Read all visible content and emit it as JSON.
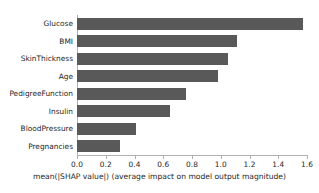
{
  "chart_data": {
    "type": "bar",
    "orientation": "horizontal",
    "title": "",
    "xlabel": "mean(|SHAP value|) (average impact on model output magnitude)",
    "ylabel": "",
    "categories": [
      "Glucose",
      "BMI",
      "SkinThickness",
      "Age",
      "PedigreeFunction",
      "Insulin",
      "BloodPressure",
      "Pregnancies"
    ],
    "values": [
      1.57,
      1.11,
      1.05,
      0.98,
      0.76,
      0.65,
      0.41,
      0.3
    ],
    "xlim": [
      0.0,
      1.6
    ],
    "xticks": [
      "0.0",
      "0.2",
      "0.4",
      "0.6",
      "0.8",
      "1.0",
      "1.2",
      "1.4",
      "1.6"
    ],
    "xtick_values": [
      0.0,
      0.2,
      0.4,
      0.6,
      0.8,
      1.0,
      1.2,
      1.4,
      1.6
    ],
    "grid": false,
    "legend": null,
    "bar_color": "#595959",
    "axis_color": "#b0b0b0",
    "text_color": "#262626",
    "background": "#ffffff"
  }
}
